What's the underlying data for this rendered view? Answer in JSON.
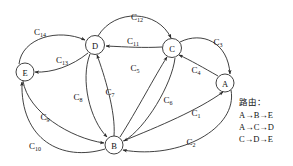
{
  "diagram": {
    "type": "directed-graph",
    "title": "",
    "nodes": [
      {
        "id": "A",
        "label": "A",
        "cx": 225,
        "cy": 83,
        "r": 9
      },
      {
        "id": "B",
        "label": "B",
        "cx": 114,
        "cy": 145,
        "r": 9
      },
      {
        "id": "C",
        "label": "C",
        "cx": 172,
        "cy": 48,
        "r": 9.5
      },
      {
        "id": "D",
        "label": "D",
        "cx": 95,
        "cy": 45,
        "r": 9.5
      },
      {
        "id": "E",
        "label": "E",
        "cx": 25,
        "cy": 72,
        "r": 9
      }
    ],
    "edges": [
      {
        "id": "C1",
        "label": "C",
        "sub": "1",
        "from": "B",
        "to": "A",
        "lx": 196,
        "ly": 113
      },
      {
        "id": "C2",
        "label": "C",
        "sub": "2",
        "from": "A",
        "to": "B",
        "lx": 191,
        "ly": 142
      },
      {
        "id": "C3",
        "label": "C",
        "sub": "3",
        "from": "C",
        "to": "A",
        "lx": 218,
        "ly": 42
      },
      {
        "id": "C4",
        "label": "C",
        "sub": "4",
        "from": "A",
        "to": "C",
        "lx": 196,
        "ly": 70
      },
      {
        "id": "C5",
        "label": "C",
        "sub": "5",
        "from": "B",
        "to": "C",
        "lx": 135,
        "ly": 68
      },
      {
        "id": "C6",
        "label": "C",
        "sub": "6",
        "from": "C",
        "to": "B",
        "lx": 168,
        "ly": 100
      },
      {
        "id": "C7",
        "label": "C",
        "sub": "7",
        "from": "B",
        "to": "D",
        "lx": 110,
        "ly": 92
      },
      {
        "id": "C8",
        "label": "C",
        "sub": "8",
        "from": "D",
        "to": "B",
        "lx": 78,
        "ly": 97
      },
      {
        "id": "C9",
        "label": "C",
        "sub": "9",
        "from": "E",
        "to": "B",
        "lx": 45,
        "ly": 117
      },
      {
        "id": "C10",
        "label": "C",
        "sub": "10",
        "from": "B",
        "to": "E",
        "lx": 35,
        "ly": 146
      },
      {
        "id": "C11",
        "label": "C",
        "sub": "11",
        "from": "C",
        "to": "D",
        "lx": 133,
        "ly": 41
      },
      {
        "id": "C12",
        "label": "C",
        "sub": "12",
        "from": "D",
        "to": "C",
        "lx": 137,
        "ly": 17
      },
      {
        "id": "C13",
        "label": "C",
        "sub": "13",
        "from": "D",
        "to": "E",
        "lx": 62,
        "ly": 60
      },
      {
        "id": "C14",
        "label": "C",
        "sub": "14",
        "from": "E",
        "to": "D",
        "lx": 40,
        "ly": 32
      }
    ]
  },
  "legend": {
    "title": "路由：",
    "routes": [
      "A→B→E",
      "A→C→D",
      "C→D→E"
    ]
  },
  "colors": {
    "stroke": "#2b2b2b",
    "background": "#ffffff",
    "text": "#111111"
  }
}
